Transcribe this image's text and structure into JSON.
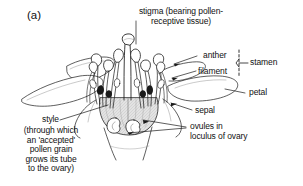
{
  "figure": {
    "panel_label": "(a)",
    "line_color": "#1a1a1a",
    "fill_color": "#ffffff",
    "shade_color": "#d8d8d8",
    "background": "#ffffff"
  },
  "labels": {
    "stigma": "stigma (bearing pollen-\nreceptive tissue)",
    "anther": "anther",
    "filament": "filament",
    "stamen": "stamen",
    "petal": "petal",
    "sepal": "sepal",
    "ovules": "ovules in\nloculus of ovary",
    "style": "style",
    "style_note": "(through which\nan 'accepted'\npollen grain\ngrows its tube\nto the ovary)"
  },
  "parts": [
    {
      "name": "stigma",
      "label": "stigma (bearing pollen-receptive tissue)"
    },
    {
      "name": "anther",
      "label": "anther"
    },
    {
      "name": "filament",
      "label": "filament"
    },
    {
      "name": "stamen",
      "label": "stamen"
    },
    {
      "name": "petal",
      "label": "petal"
    },
    {
      "name": "sepal",
      "label": "sepal"
    },
    {
      "name": "ovules",
      "label": "ovules in loculus of ovary"
    },
    {
      "name": "style",
      "label": "style"
    }
  ]
}
